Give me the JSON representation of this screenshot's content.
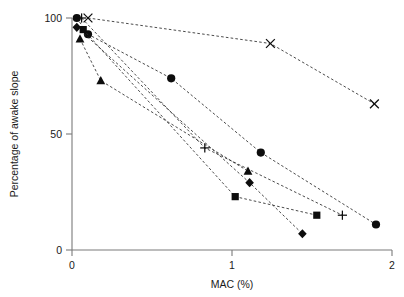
{
  "chart_data": {
    "type": "line",
    "title": "",
    "xlabel": "MAC (%)",
    "ylabel": "Percentage of awake slope",
    "xlim": [
      0,
      2
    ],
    "ylim": [
      0,
      100
    ],
    "xticks": [
      0,
      1,
      2
    ],
    "xtick_labels": [
      "0",
      "1",
      "2"
    ],
    "yticks": [
      0,
      50,
      100
    ],
    "ytick_labels": [
      "0",
      "50",
      "100"
    ],
    "grid": false,
    "legend": "none",
    "series": [
      {
        "name": "Series 1",
        "marker": "circle",
        "x": [
          0.03,
          0.1,
          0.62,
          1.18,
          1.9
        ],
        "y": [
          100,
          93,
          74,
          42,
          11
        ]
      },
      {
        "name": "Series 2",
        "marker": "plus",
        "x": [
          0.06,
          0.83,
          1.69
        ],
        "y": [
          100,
          44,
          15
        ]
      },
      {
        "name": "Series 3",
        "marker": "cross",
        "x": [
          0.1,
          1.24,
          1.89
        ],
        "y": [
          100,
          89,
          63
        ]
      },
      {
        "name": "Series 4",
        "marker": "diamond",
        "x": [
          0.03,
          1.11,
          1.44
        ],
        "y": [
          96,
          29,
          7
        ]
      },
      {
        "name": "Series 5",
        "marker": "square",
        "x": [
          0.07,
          1.02,
          1.53
        ],
        "y": [
          95,
          23,
          15
        ]
      },
      {
        "name": "Series 6",
        "marker": "triangle",
        "x": [
          0.05,
          0.18,
          1.1
        ],
        "y": [
          91,
          73,
          34
        ]
      }
    ]
  },
  "axes": {
    "y_title": "Percentage of awake slope",
    "x_title": "MAC (%)"
  }
}
